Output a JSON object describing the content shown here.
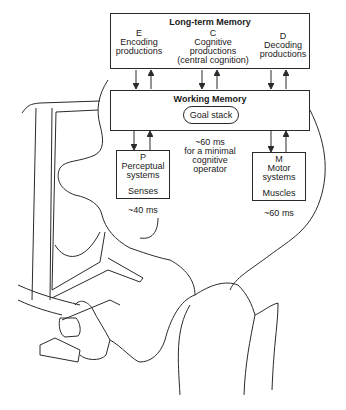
{
  "long_term_memory": {
    "title": "Long-term Memory",
    "sections": [
      {
        "letter": "E",
        "line1": "Encoding",
        "line2": "productions",
        "line3": ""
      },
      {
        "letter": "C",
        "line1": "Cognitive",
        "line2": "productions",
        "line3": "(central cognition)"
      },
      {
        "letter": "D",
        "line1": "Decoding",
        "line2": "productions",
        "line3": ""
      }
    ]
  },
  "working_memory": {
    "title": "Working Memory",
    "goal_stack": "Goal stack"
  },
  "cognitive_timing": {
    "line1": "~60 ms",
    "line2": "for a minimal",
    "line3": "cognitive",
    "line4": "operator"
  },
  "perceptual": {
    "letter": "P",
    "line1": "Perceptual",
    "line2": "systems",
    "sub": "Senses",
    "timing": "~40 ms"
  },
  "motor": {
    "letter": "M",
    "line1": "Motor",
    "line2": "systems",
    "sub": "Muscles",
    "timing": "~60 ms"
  },
  "colors": {
    "line": "#2a2a2a",
    "background": "#ffffff"
  }
}
